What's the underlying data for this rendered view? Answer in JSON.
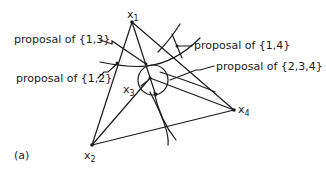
{
  "figure": {
    "panel_label": "(a)",
    "points": {
      "x1": {
        "label": "x",
        "sub": "1"
      },
      "x2": {
        "label": "x",
        "sub": "2"
      },
      "x3": {
        "label": "x",
        "sub": "3"
      },
      "x4": {
        "label": "x",
        "sub": "4"
      }
    },
    "annotations": [
      {
        "id": "p13",
        "text": "proposal of {1,3}"
      },
      {
        "id": "p12",
        "text": "proposal of {1,2}"
      },
      {
        "id": "p14",
        "text": "proposal of {1,4}"
      },
      {
        "id": "p234",
        "text": "proposal of {2,3,4}"
      }
    ],
    "colors": {
      "ink": "#1a1a1a",
      "background": "#ffffff"
    }
  }
}
